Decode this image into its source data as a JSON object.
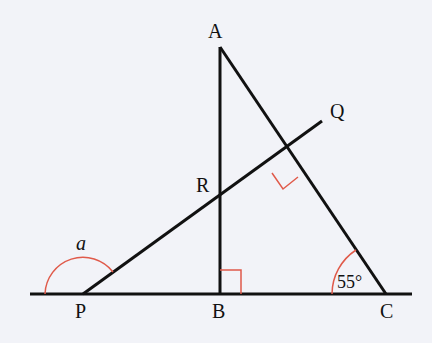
{
  "diagram": {
    "type": "geometry",
    "background": "#f2f3f8",
    "line_color": "#111111",
    "marker_color": "#e05a4a",
    "points": {
      "A": {
        "label": "A",
        "x": 220,
        "y": 47
      },
      "B": {
        "label": "B",
        "x": 220,
        "y": 294
      },
      "C": {
        "label": "C",
        "x": 385,
        "y": 294
      },
      "P": {
        "label": "P",
        "x": 83,
        "y": 294
      },
      "Q": {
        "label": "Q",
        "x": 322,
        "y": 121
      },
      "R": {
        "label": "R",
        "x": 220,
        "y": 200
      }
    },
    "angle_labels": {
      "a": "a",
      "C_angle": "55°"
    },
    "facts": [
      "AB is perpendicular to PC at B",
      "PQ is perpendicular to AC",
      "Angle ACB = 55°",
      "a is the reflex/obtuse angle at P on the left side"
    ]
  }
}
